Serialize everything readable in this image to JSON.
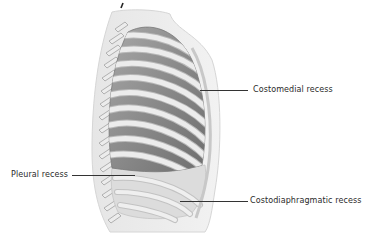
{
  "figure": {
    "colors": {
      "body_outline": "#e2e2e2",
      "rib": "#ebebeb",
      "rib_edge": "#b5b5b5",
      "lung": "#8e8e8e",
      "lung_dark": "#6f6f6f",
      "leader_line": "#333333",
      "label_text": "#2a2a2a"
    }
  },
  "labels": [
    {
      "id": "costomedial",
      "text": "Costomedial recess"
    },
    {
      "id": "pleural",
      "text": "Pleural recess"
    },
    {
      "id": "costodiaphragmatic",
      "text": "Costodiaphragmatic recess"
    }
  ]
}
